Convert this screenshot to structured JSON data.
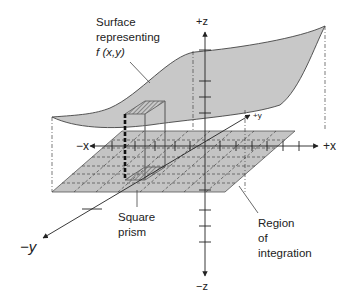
{
  "diagram": {
    "axes": {
      "pos_z": "+z",
      "neg_z": "−z",
      "pos_x": "+x",
      "neg_x": "−x",
      "pos_y": "+y",
      "neg_y": "−y"
    },
    "labels": {
      "surface_line1": "Surface",
      "surface_line2": "representing",
      "surface_line3": "f (x,y)",
      "prism_line1": "Square",
      "prism_line2": "prism",
      "region_line1": "Region",
      "region_line2": "of",
      "region_line3": "integration"
    },
    "colors": {
      "surface_fill": "#c8c8c8",
      "region_fill": "#c4c4c4",
      "line": "#333333"
    }
  }
}
